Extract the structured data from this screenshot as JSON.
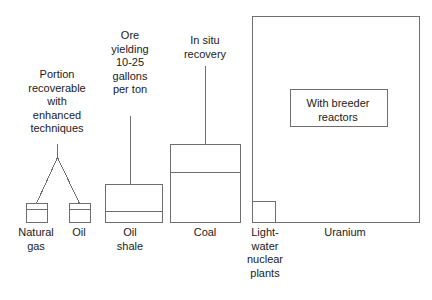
{
  "diagram": {
    "style": {
      "stroke_color": "#6e6e6e",
      "text_color": "#1a1a1a",
      "background": "#ffffff",
      "stroke_width": 1
    },
    "annotations": [
      {
        "id": "portion-recoverable",
        "text": "Portion\nrecoverable\nwith\nenhanced\ntechniques",
        "x": 57,
        "y": 68
      },
      {
        "id": "ore-yielding",
        "text": "Ore\nyielding\n10-25\ngallons\nper ton",
        "x": 130,
        "y": 29
      },
      {
        "id": "in-situ-recovery",
        "text": "In situ\nrecovery",
        "x": 205,
        "y": 34
      }
    ],
    "resources": [
      {
        "id": "natural-gas",
        "label": "Natural\ngas",
        "label_x": 36,
        "label_y": 226,
        "box": {
          "x": 26,
          "y": 203,
          "w": 21,
          "h": 19
        },
        "divider_y": 209
      },
      {
        "id": "oil",
        "label": "Oil",
        "label_x": 79,
        "label_y": 226,
        "box": {
          "x": 69,
          "y": 203,
          "w": 21,
          "h": 19
        },
        "divider_y": 209
      },
      {
        "id": "oil-shale",
        "label": "Oil\nshale",
        "label_x": 130,
        "label_y": 226,
        "box": {
          "x": 105,
          "y": 184,
          "w": 57,
          "h": 38
        },
        "divider_y": 211
      },
      {
        "id": "coal",
        "label": "Coal",
        "label_x": 205,
        "label_y": 226,
        "box": {
          "x": 170,
          "y": 144,
          "w": 70,
          "h": 78
        },
        "divider_y": 172
      },
      {
        "id": "light-water-nuclear-plants",
        "label": "Light-\nwater\nnuclear\nplants",
        "label_x": 265,
        "label_y": 226,
        "box": {
          "x": 252,
          "y": 201,
          "w": 23,
          "h": 21
        }
      },
      {
        "id": "uranium",
        "label": "Uranium",
        "label_x": 345,
        "label_y": 226,
        "box": {
          "x": 252,
          "y": 16,
          "w": 167,
          "h": 206
        }
      }
    ],
    "inner_boxes": [
      {
        "id": "with-breeder-reactors",
        "label": "With breeder\nreactors",
        "box": {
          "x": 290,
          "y": 89,
          "w": 97,
          "h": 37
        },
        "label_x": 338,
        "label_y": 96
      }
    ],
    "connectors": [
      {
        "id": "portion-recoverable-branch",
        "type": "branch",
        "stem": {
          "x": 57,
          "y1": 143,
          "y2": 157
        },
        "legs": [
          {
            "x1": 57,
            "y1": 157,
            "x2": 36,
            "y2": 203
          },
          {
            "x1": 57,
            "y1": 157,
            "x2": 79,
            "y2": 203
          }
        ]
      },
      {
        "id": "ore-yielding-leader",
        "type": "line",
        "x1": 130,
        "y1": 115,
        "x2": 130,
        "y2": 184
      },
      {
        "id": "in-situ-recovery-leader",
        "type": "line",
        "x1": 205,
        "y1": 65,
        "x2": 205,
        "y2": 144
      }
    ]
  }
}
